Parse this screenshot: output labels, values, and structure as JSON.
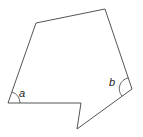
{
  "diagram": {
    "type": "irregular hexagon (concave polygon)",
    "stroke_color": "#555555",
    "vertices": [
      [
        36,
        23
      ],
      [
        105,
        9
      ],
      [
        132,
        89
      ],
      [
        77,
        129
      ],
      [
        81,
        103
      ],
      [
        8,
        103
      ]
    ],
    "angles": [
      {
        "label": "a",
        "vertex": [
          8,
          103
        ],
        "label_pos": [
          19,
          96
        ]
      },
      {
        "label": "b",
        "vertex": [
          132,
          89
        ],
        "label_pos": [
          110,
          85
        ]
      }
    ]
  }
}
